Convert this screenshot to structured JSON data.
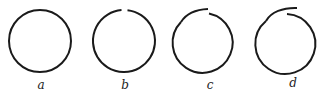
{
  "figure": {
    "panels": [
      {
        "label": "a",
        "state": "closed circle"
      },
      {
        "label": "b",
        "state": "small gap at top"
      },
      {
        "label": "c",
        "state": "ends slightly overlap at top"
      },
      {
        "label": "d",
        "state": "ends overlap more at top"
      }
    ],
    "colors": {
      "stroke": "#1a1a1a",
      "background": "#ffffff"
    }
  }
}
